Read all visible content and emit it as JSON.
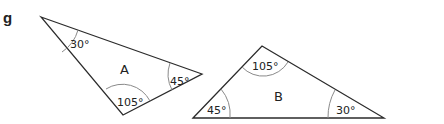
{
  "question_label": "g",
  "triangles": [
    {
      "name": "A",
      "vertices": [
        [
          41,
          17
        ],
        [
          202,
          74
        ],
        [
          123,
          115
        ]
      ],
      "angles": [
        {
          "label": "30°",
          "at": "top-left"
        },
        {
          "label": "45°",
          "at": "right"
        },
        {
          "label": "105°",
          "at": "bottom"
        }
      ]
    },
    {
      "name": "B",
      "vertices": [
        [
          193,
          118
        ],
        [
          262,
          46
        ],
        [
          384,
          118
        ]
      ],
      "angles": [
        {
          "label": "45°",
          "at": "bottom-left"
        },
        {
          "label": "105°",
          "at": "top"
        },
        {
          "label": "30°",
          "at": "bottom-right"
        }
      ]
    }
  ],
  "colors": {
    "stroke": "#2b2b2b",
    "arc": "#8a8a8a",
    "text": "#222222"
  }
}
